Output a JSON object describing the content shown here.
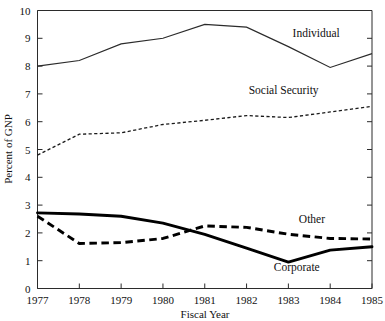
{
  "chart_data": {
    "type": "line",
    "title": "",
    "xlabel": "Fiscal Year",
    "ylabel": "Percent of GNP",
    "categories": [
      1977,
      1978,
      1979,
      1980,
      1981,
      1982,
      1983,
      1984,
      1985
    ],
    "x_tick_labels": [
      "1977",
      "1978",
      "1979",
      "1980",
      "1981",
      "1982",
      "1983",
      "1984",
      "1985"
    ],
    "y_tick_labels": [
      "0",
      "1",
      "2",
      "3",
      "4",
      "5",
      "6",
      "7",
      "8",
      "9",
      "10"
    ],
    "y_ticks": [
      0,
      1,
      2,
      3,
      4,
      5,
      6,
      7,
      8,
      9,
      10
    ],
    "ylim": [
      0,
      10
    ],
    "xlim": [
      1977,
      1985
    ],
    "grid": false,
    "legend_position": "inline-right",
    "series": [
      {
        "name": "Individual",
        "style": "thin-solid",
        "color": "#2b2b2b",
        "values": [
          8.0,
          8.2,
          8.8,
          9.0,
          9.5,
          9.4,
          8.7,
          7.95,
          8.45
        ],
        "label_x": 1983.1,
        "label_y": 9.05
      },
      {
        "name": "Social Security",
        "style": "fine-dotted",
        "color": "#1a1a1a",
        "values": [
          4.8,
          5.55,
          5.6,
          5.9,
          6.05,
          6.22,
          6.15,
          6.35,
          6.55
        ],
        "label_x": 1982.05,
        "label_y": 7.0
      },
      {
        "name": "Other",
        "style": "thick-dashed",
        "color": "#000000",
        "values": [
          2.6,
          1.62,
          1.65,
          1.8,
          2.25,
          2.2,
          1.95,
          1.8,
          1.78
        ],
        "label_x": 1983.25,
        "label_y": 2.35
      },
      {
        "name": "Corporate",
        "style": "thick-solid",
        "color": "#000000",
        "values": [
          2.72,
          2.68,
          2.6,
          2.35,
          1.95,
          1.45,
          0.95,
          1.38,
          1.5
        ],
        "label_x": 1982.65,
        "label_y": 0.62
      }
    ]
  }
}
